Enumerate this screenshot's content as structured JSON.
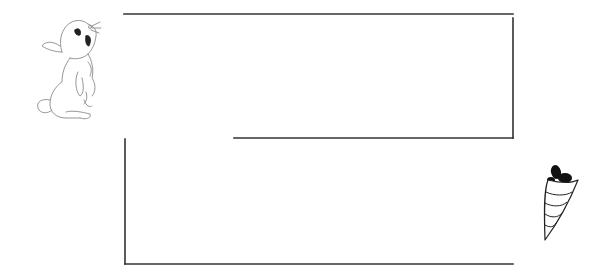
{
  "puzzle": {
    "type": "maze",
    "description": "Help the rabbit reach the carrot",
    "start": {
      "character": "rabbit",
      "icon": "rabbit-icon"
    },
    "goal": {
      "item": "carrot",
      "icon": "carrot-icon"
    }
  },
  "colors": {
    "background": "#ffffff",
    "wall": "#333333",
    "outline": "#888888",
    "carrot_leaf": "#111111"
  }
}
